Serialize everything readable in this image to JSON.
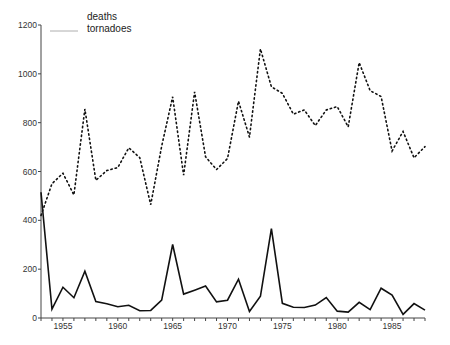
{
  "chart_data": {
    "type": "line",
    "title": "",
    "xlabel": "",
    "ylabel": "",
    "xlim": [
      1953,
      1988
    ],
    "ylim": [
      0,
      1200
    ],
    "grid": false,
    "legend_position": "top-left",
    "x_ticks": [
      1955,
      1960,
      1965,
      1970,
      1975,
      1980,
      1985
    ],
    "y_ticks": [
      0,
      200,
      400,
      600,
      800,
      1000,
      1200
    ],
    "x": [
      1953,
      1954,
      1955,
      1956,
      1957,
      1958,
      1959,
      1960,
      1961,
      1962,
      1963,
      1964,
      1965,
      1966,
      1967,
      1968,
      1969,
      1970,
      1971,
      1972,
      1973,
      1974,
      1975,
      1976,
      1977,
      1978,
      1979,
      1980,
      1981,
      1982,
      1983,
      1984,
      1985,
      1986,
      1987,
      1988
    ],
    "series": [
      {
        "name": "deaths",
        "style": "solid",
        "values": [
          515,
          36,
          126,
          83,
          192,
          67,
          58,
          46,
          52,
          30,
          31,
          73,
          301,
          98,
          114,
          131,
          66,
          73,
          159,
          27,
          89,
          366,
          60,
          44,
          43,
          53,
          84,
          28,
          24,
          64,
          34,
          122,
          94,
          15,
          59,
          32
        ]
      },
      {
        "name": "tornadoes",
        "style": "dotted",
        "values": [
          420,
          550,
          593,
          504,
          856,
          564,
          604,
          616,
          697,
          657,
          464,
          704,
          906,
          585,
          926,
          660,
          608,
          653,
          888,
          741,
          1102,
          947,
          920,
          835,
          852,
          788,
          852,
          866,
          783,
          1046,
          931,
          907,
          684,
          764,
          656,
          702
        ]
      }
    ],
    "legend": [
      "deaths",
      "tornadoes"
    ]
  }
}
